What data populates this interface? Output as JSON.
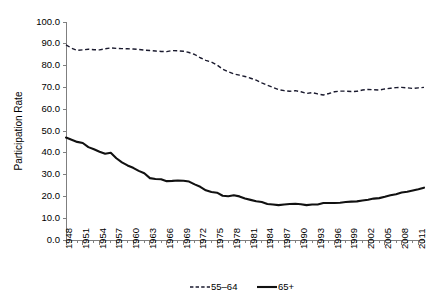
{
  "chart_data": {
    "type": "line",
    "title": "",
    "xlabel": "",
    "ylabel": "Participation Rate",
    "ylim": [
      0,
      100
    ],
    "ytick_values": [
      0,
      10,
      20,
      30,
      40,
      50,
      60,
      70,
      80,
      90,
      100
    ],
    "ytick_labels": [
      "0.0",
      "10.0",
      "20.0",
      "30.0",
      "40.0",
      "50.0",
      "60.0",
      "70.0",
      "80.0",
      "90.0",
      "100.0"
    ],
    "xlim": [
      1948,
      2012
    ],
    "xtick_labels": [
      "1948",
      "1951",
      "1954",
      "1957",
      "1960",
      "1963",
      "1966",
      "1969",
      "1972",
      "1975",
      "1978",
      "1981",
      "1984",
      "1987",
      "1990",
      "1993",
      "1996",
      "1999",
      "2002",
      "2005",
      "2008",
      "2011"
    ],
    "xtick_step_years": 3,
    "minor_tick_step_years": 1,
    "grid": false,
    "legend_position": "bottom-center",
    "x": [
      1948,
      1949,
      1950,
      1951,
      1952,
      1953,
      1954,
      1955,
      1956,
      1957,
      1958,
      1959,
      1960,
      1961,
      1962,
      1963,
      1964,
      1965,
      1966,
      1967,
      1968,
      1969,
      1970,
      1971,
      1972,
      1973,
      1974,
      1975,
      1976,
      1977,
      1978,
      1979,
      1980,
      1981,
      1982,
      1983,
      1984,
      1985,
      1986,
      1987,
      1988,
      1989,
      1990,
      1991,
      1992,
      1993,
      1994,
      1995,
      1996,
      1997,
      1998,
      1999,
      2000,
      2001,
      2002,
      2003,
      2004,
      2005,
      2006,
      2007,
      2008,
      2009,
      2010,
      2011,
      2012
    ],
    "series": [
      {
        "name": "55–64",
        "style": "dashed",
        "color": "#1a1a2e",
        "values": [
          89.5,
          88.0,
          87.0,
          87.2,
          87.5,
          87.3,
          87.2,
          87.7,
          88.1,
          87.9,
          87.8,
          87.7,
          87.6,
          87.4,
          87.1,
          86.9,
          86.7,
          86.5,
          86.4,
          86.9,
          86.8,
          86.6,
          86.0,
          85.1,
          83.6,
          82.4,
          81.6,
          80.3,
          78.4,
          77.2,
          76.2,
          75.6,
          75.0,
          74.2,
          73.3,
          72.1,
          71.0,
          70.0,
          69.0,
          68.5,
          68.2,
          68.5,
          68.0,
          67.2,
          67.6,
          67.0,
          66.5,
          67.2,
          68.0,
          68.3,
          68.3,
          68.1,
          68.2,
          68.8,
          69.1,
          68.9,
          68.8,
          69.3,
          69.6,
          69.9,
          70.0,
          69.8,
          69.5,
          69.8,
          70.0
        ]
      },
      {
        "name": "65+",
        "style": "solid",
        "color": "#111111",
        "values": [
          47.0,
          46.0,
          45.0,
          44.5,
          42.6,
          41.6,
          40.5,
          39.6,
          40.0,
          37.5,
          35.6,
          34.2,
          33.1,
          31.7,
          30.6,
          28.4,
          28.0,
          27.9,
          27.0,
          27.1,
          27.3,
          27.2,
          26.8,
          25.5,
          24.4,
          22.8,
          22.0,
          21.7,
          20.3,
          20.1,
          20.5,
          20.0,
          19.0,
          18.4,
          17.8,
          17.4,
          16.5,
          16.3,
          16.0,
          16.3,
          16.5,
          16.6,
          16.4,
          16.0,
          16.3,
          16.3,
          17.0,
          17.0,
          17.0,
          17.1,
          17.4,
          17.6,
          17.7,
          18.1,
          18.5,
          19.0,
          19.2,
          19.8,
          20.5,
          21.0,
          21.8,
          22.1,
          22.7,
          23.3,
          24.0
        ]
      }
    ]
  },
  "legend": {
    "entries": [
      {
        "label": "55–64",
        "style": "dashed"
      },
      {
        "label": "65+",
        "style": "solid"
      }
    ]
  },
  "axes": {
    "y_title": "Participation Rate"
  }
}
